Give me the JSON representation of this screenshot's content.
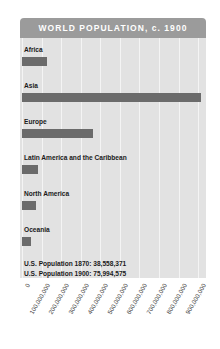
{
  "title": "WORLD POPULATION, c. 1900",
  "colors": {
    "band": "#9b9b9b",
    "plot_background": "#e2e2e2",
    "bar": "#6b6b6b",
    "gridline": "#f4f4f4",
    "title_text": "#ffffff",
    "label_text": "#1a1a1a"
  },
  "notes": [
    "U.S. Population 1870: 38,558,371",
    "U.S. Population 1900: 75,994,575"
  ],
  "chart_data": {
    "type": "bar",
    "orientation": "horizontal",
    "title": "WORLD POPULATION, c. 1900",
    "xlabel": "",
    "ylabel": "",
    "grid": true,
    "legend": "none",
    "xlim": [
      0,
      930000000
    ],
    "categories": [
      "Africa",
      "Asia",
      "Europe",
      "Latin America and the Caribbean",
      "North America",
      "Oceania"
    ],
    "values": [
      130000000,
      915000000,
      365000000,
      80000000,
      70000000,
      45000000
    ],
    "tick_values": [
      0,
      100000000,
      200000000,
      300000000,
      400000000,
      500000000,
      600000000,
      700000000,
      800000000,
      900000000
    ],
    "tick_labels": [
      "0",
      "100,000,000",
      "200,000,000",
      "300,000,000",
      "400,000,000",
      "500,000,000",
      "600,000,000",
      "700,000,000",
      "800,000,000",
      "900,000,000"
    ],
    "annotations": [
      "U.S. Population 1870: 38,558,371",
      "U.S. Population 1900: 75,994,575"
    ]
  }
}
